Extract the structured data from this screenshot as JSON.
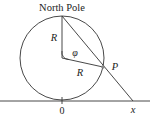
{
  "diagram": {
    "title_label": "North Pole",
    "labels": {
      "radius_vertical": "R",
      "radius_to_p": "R",
      "angle": "φ",
      "point": "P",
      "origin": "0",
      "projection": "x"
    },
    "colors": {
      "stroke": "#333333",
      "text": "#222222",
      "point_fill": "#888888"
    }
  }
}
